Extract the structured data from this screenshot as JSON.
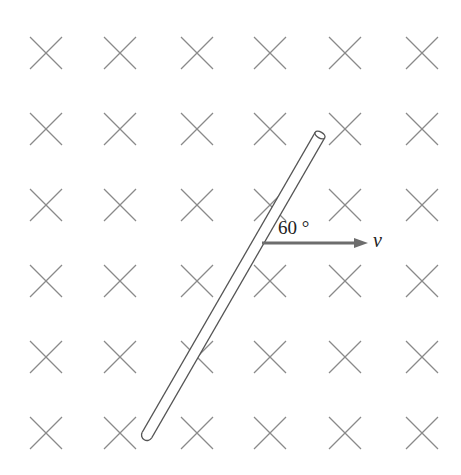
{
  "diagram": {
    "field": {
      "symbol": "cross-into-page",
      "columns_x": [
        46,
        120,
        197,
        270,
        345,
        422
      ],
      "rows_y": [
        53,
        129,
        205,
        281,
        357,
        433
      ],
      "color": "#8a8a8a"
    },
    "rod": {
      "bottom": [
        147,
        435
      ],
      "top": [
        320,
        135
      ],
      "color": "#555555"
    },
    "velocity": {
      "label": "v",
      "origin": [
        262,
        243
      ],
      "end": [
        368,
        243
      ],
      "color": "#6d6d6d"
    },
    "angle": {
      "label": "60 °"
    }
  }
}
